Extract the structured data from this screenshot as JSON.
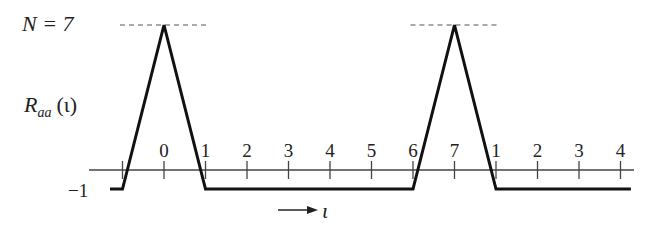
{
  "chart_data": {
    "type": "line",
    "title": "",
    "annotation_top": "N = 7",
    "ylabel": "R_aa(ι)",
    "ylabel_main": "R",
    "ylabel_sub": "aa",
    "ylabel_arg": "(ι)",
    "y_min_label": "−1",
    "x_arrow_label": "ι",
    "x_positions": [
      -1,
      0,
      1,
      2,
      3,
      4,
      5,
      6,
      7,
      8,
      9,
      10,
      11
    ],
    "tick_labels": [
      "",
      "0",
      "1",
      "2",
      "3",
      "4",
      "5",
      "6",
      "7",
      "1",
      "2",
      "3",
      "4"
    ],
    "peak_value": 7,
    "baseline_value": -1,
    "series": [
      {
        "name": "R_aa",
        "points": [
          {
            "x": -1.3,
            "y": -1
          },
          {
            "x": -1,
            "y": -1
          },
          {
            "x": 0,
            "y": 7
          },
          {
            "x": 1,
            "y": -1
          },
          {
            "x": 6,
            "y": -1
          },
          {
            "x": 7,
            "y": 7
          },
          {
            "x": 8,
            "y": -1
          },
          {
            "x": 11.25,
            "y": -1
          }
        ]
      }
    ],
    "peak_reference_x": [
      0,
      7
    ],
    "period": 7
  }
}
